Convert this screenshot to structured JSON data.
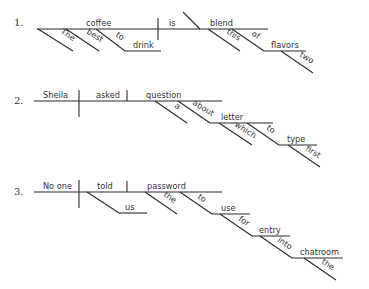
{
  "diagrams": [
    {
      "number": "1.",
      "subject": "coffee",
      "verb": "is",
      "complement": "blend",
      "modifiers": {
        "the": "The",
        "best": "best",
        "to": "to",
        "drink": "drink",
        "this": "this",
        "of": "of",
        "flavors": "flavors",
        "two": "two"
      }
    },
    {
      "number": "2.",
      "subject": "Sheila",
      "verb": "asked",
      "object": "question",
      "modifiers": {
        "a": "a",
        "about": "about",
        "letter": "letter",
        "which": "which",
        "to": "to",
        "type": "type",
        "first": "first"
      }
    },
    {
      "number": "3.",
      "subject": "No one",
      "verb": "told",
      "object": "password",
      "modifiers": {
        "us": "us",
        "the": "the",
        "to": "to",
        "use": "use",
        "for": "for",
        "entry": "entry",
        "into": "into",
        "chatroom": "chatroom",
        "the2": "the"
      }
    }
  ]
}
